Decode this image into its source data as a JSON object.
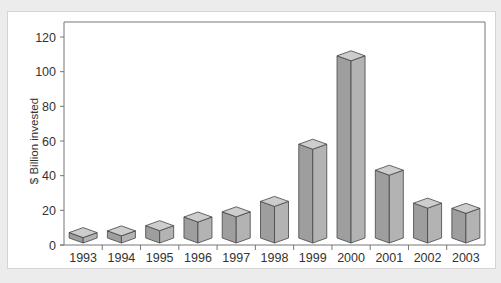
{
  "chart_data": {
    "type": "bar",
    "title": "",
    "xlabel": "",
    "ylabel": "$ Billion invested",
    "categories": [
      "1993",
      "1994",
      "1995",
      "1996",
      "1997",
      "1998",
      "1999",
      "2000",
      "2001",
      "2002",
      "2003"
    ],
    "values": [
      6,
      7,
      10,
      15,
      18,
      24,
      57,
      108,
      42,
      23,
      20
    ],
    "ylim": [
      0,
      120
    ],
    "yticks": [
      0,
      20,
      40,
      60,
      80,
      100,
      120
    ],
    "grid": false,
    "style": "3d-boxes",
    "colors": {
      "front": "#9e9e9e",
      "side": "#b3b3b3",
      "top": "#cdcdcd",
      "edge": "#444444"
    }
  }
}
